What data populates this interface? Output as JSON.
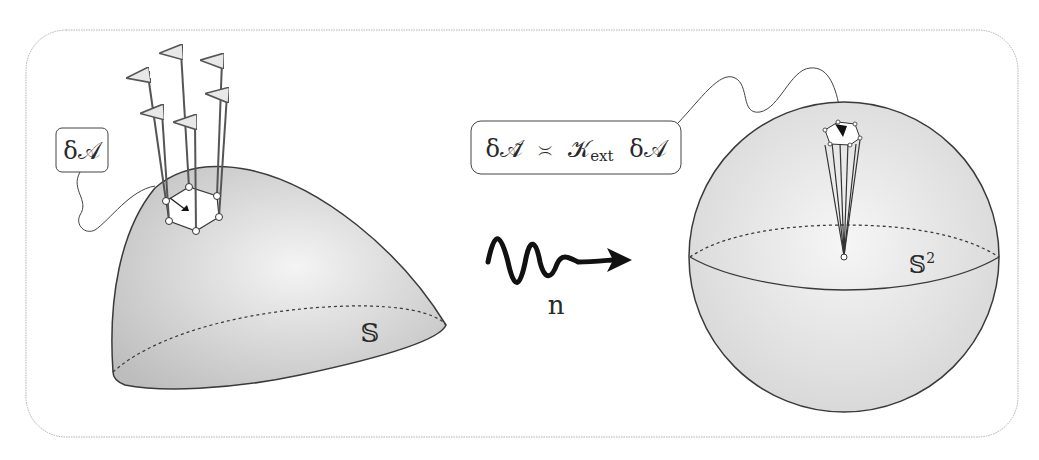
{
  "diagram": {
    "left": {
      "surface_label": "𝕊",
      "area_label": "δ𝒜",
      "normals_count": 7
    },
    "map": {
      "label": "n"
    },
    "right": {
      "sphere_label": "𝕊",
      "sphere_superscript": "2",
      "formula_parts": {
        "lhs": "δ𝒜̃",
        "relation": "≍",
        "k": "𝒦",
        "k_sub": "ext",
        "rhs": "δ𝒜"
      }
    },
    "colors": {
      "stroke": "#3a3a3a",
      "surface_fill": "#d8d8d8",
      "frame": "#b0b0b0"
    }
  }
}
